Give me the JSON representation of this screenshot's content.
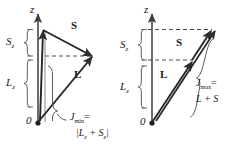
{
  "figure": {
    "type": "vector-diagram",
    "background_color": "#ffffff",
    "stroke_color": "#3a3a3a",
    "panels": [
      {
        "id": "left",
        "axis_label": "z",
        "origin_label": "0",
        "brace_upper_label": "S",
        "brace_upper_sub": "z",
        "brace_lower_label": "L",
        "brace_lower_sub": "z",
        "vector_s_label": "S",
        "vector_l_label": "L",
        "result_label": "J",
        "result_sub": "min",
        "result_equals": "=",
        "result_expr": "|L",
        "result_expr_sub1": "z",
        "result_expr_mid": " + S",
        "result_expr_sub2": "z",
        "result_expr_end": "|",
        "result_full": "J_min = |L_z + S_z|"
      },
      {
        "id": "right",
        "axis_label": "z",
        "origin_label": "0",
        "brace_upper_label": "S",
        "brace_upper_sub": "z",
        "brace_lower_label": "L",
        "brace_lower_sub": "z",
        "vector_s_label": "S",
        "vector_l_label": "L",
        "result_label": "J",
        "result_sub": "max",
        "result_equals": "=",
        "result_expr": "L + S",
        "result_full": "J_max = L + S"
      }
    ]
  }
}
